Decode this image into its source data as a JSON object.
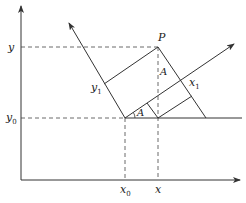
{
  "diagram": {
    "type": "coordinate-rotation",
    "colors": {
      "line": "#333333",
      "dashed": "#444444",
      "text": "#222222"
    },
    "labels": {
      "y_axis": "y",
      "y0": "y",
      "y0_sub": "0",
      "x0": "x",
      "x0_sub": "0",
      "x_tick": "x",
      "point": "P",
      "x1": "x",
      "x1_sub": "1",
      "y1": "y",
      "y1_sub": "1",
      "angle_at_origin": "A",
      "angle_at_P": "A"
    },
    "points": {
      "origin_axes": [
        21,
        180
      ],
      "rotated_origin": [
        125,
        118
      ],
      "P": [
        158,
        47
      ],
      "x_foot": [
        158,
        118
      ],
      "x1_axis_tip": [
        234,
        44
      ],
      "y1_axis_tip": [
        69,
        23
      ]
    }
  }
}
